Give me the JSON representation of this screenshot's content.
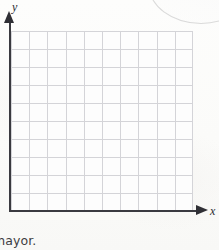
{
  "figure": {
    "kind": "empty-coordinate-grid",
    "y_axis_label": "y",
    "x_axis_label": "x",
    "grid": {
      "columns": 10,
      "rows": 10,
      "cell_width_px": 18,
      "cell_height_px": 18,
      "line_color": "#d4d4d8",
      "has_tick_labels": false,
      "has_data": false
    },
    "axis_color": "#3a3a40",
    "background_color": "#fcfcfa"
  },
  "page_text": {
    "clipped_bottom_word": "mayor."
  },
  "chart_data": {
    "type": "scatter",
    "title": "",
    "xlabel": "x",
    "ylabel": "y",
    "categories": [],
    "series": [],
    "x": [],
    "values": [],
    "xlim": [
      0,
      10
    ],
    "ylim": [
      0,
      10
    ],
    "grid": true,
    "legend": "none",
    "tick_labels_x": [],
    "tick_labels_y": [],
    "annotations": []
  }
}
